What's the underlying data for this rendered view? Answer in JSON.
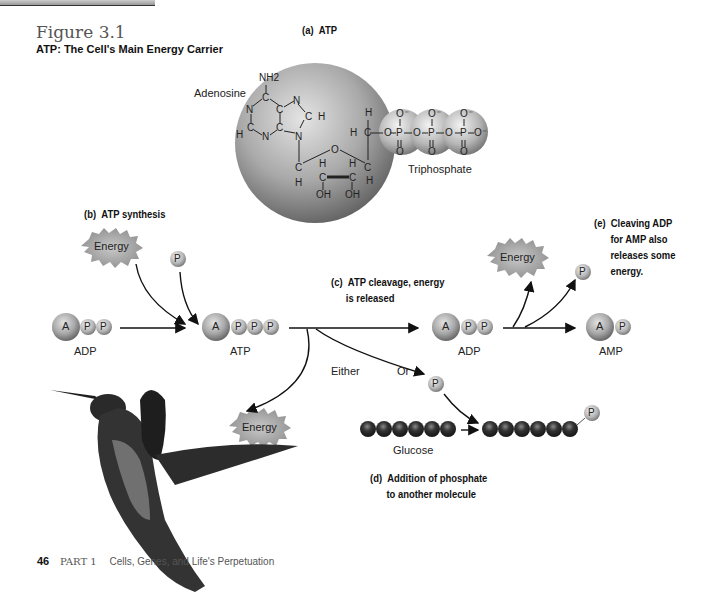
{
  "figure": {
    "number": "Figure 3.1",
    "title": "ATP: The Cell's Main Energy Carrier"
  },
  "panels": {
    "a": {
      "tag": "(a)",
      "label": "ATP",
      "adenosine_label": "Adenosine",
      "triphosphate_label": "Triphosphate"
    },
    "b": {
      "tag": "(b)",
      "label": "ATP synthesis"
    },
    "c": {
      "tag": "(c)",
      "line1": "ATP cleavage, energy",
      "line2": "is released"
    },
    "d": {
      "tag": "(d)",
      "line1": "Addition of phosphate",
      "line2": "to another molecule"
    },
    "e": {
      "tag": "(e)",
      "line1": "Cleaving ADP",
      "line2": "for AMP also",
      "line3": "releases some",
      "line4": "energy."
    }
  },
  "molecules": {
    "adp_left": "ADP",
    "atp": "ATP",
    "adp_right": "ADP",
    "amp": "AMP",
    "glucose": "Glucose",
    "adenine_symbol": "A",
    "phosphate_symbol": "P"
  },
  "energy_label": "Energy",
  "branch_labels": {
    "either": "Either",
    "or": "Or"
  },
  "chemistry": {
    "nh2": "NH2",
    "n": "N",
    "c": "C",
    "h": "H",
    "o": "O",
    "oh": "OH",
    "p": "P",
    "o_minus": "O⁻"
  },
  "footer": {
    "page_number": "46",
    "part": "PART 1",
    "part_title": "Cells, Genes, and Life's Perpetuation"
  },
  "colors": {
    "sphere_light": "#d8d8d8",
    "sphere_dark": "#6a6a6a",
    "energy_fill": "#9a9a9a",
    "glucose_bead": "#222222"
  }
}
